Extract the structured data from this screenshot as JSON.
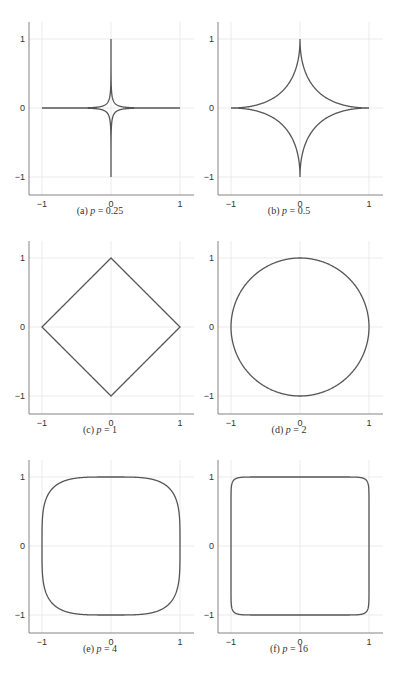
{
  "chart_data": [
    {
      "type": "line",
      "id": "a",
      "label": "(a)",
      "p": 0.25,
      "caption": "(a) p = 0.25",
      "title": "Unit ball boundary |x|^p + |y|^p = 1",
      "xticks": [
        -1,
        0,
        1
      ],
      "yticks": [
        -1,
        0,
        1
      ],
      "xlim": [
        -1.2,
        1.2
      ],
      "ylim": [
        -1.2,
        1.2
      ],
      "grid": true,
      "color": "#555555"
    },
    {
      "type": "line",
      "id": "b",
      "label": "(b)",
      "p": 0.5,
      "caption": "(b) p = 0.5",
      "title": "Unit ball boundary |x|^p + |y|^p = 1",
      "xticks": [
        -1,
        0,
        1
      ],
      "yticks": [
        -1,
        0,
        1
      ],
      "xlim": [
        -1.2,
        1.2
      ],
      "ylim": [
        -1.2,
        1.2
      ],
      "grid": true,
      "color": "#555555"
    },
    {
      "type": "line",
      "id": "c",
      "label": "(c)",
      "p": 1,
      "caption": "(c) p = 1",
      "title": "Unit ball boundary |x|^p + |y|^p = 1",
      "xticks": [
        -1,
        0,
        1
      ],
      "yticks": [
        -1,
        0,
        1
      ],
      "xlim": [
        -1.2,
        1.2
      ],
      "ylim": [
        -1.2,
        1.2
      ],
      "grid": true,
      "color": "#555555"
    },
    {
      "type": "line",
      "id": "d",
      "label": "(d)",
      "p": 2,
      "caption": "(d) p = 2",
      "title": "Unit ball boundary |x|^p + |y|^p = 1",
      "xticks": [
        -1,
        0,
        1
      ],
      "yticks": [
        -1,
        0,
        1
      ],
      "xlim": [
        -1.2,
        1.2
      ],
      "ylim": [
        -1.2,
        1.2
      ],
      "grid": true,
      "color": "#555555"
    },
    {
      "type": "line",
      "id": "e",
      "label": "(e)",
      "p": 4,
      "caption": "(e) p = 4",
      "title": "Unit ball boundary |x|^p + |y|^p = 1",
      "xticks": [
        -1,
        0,
        1
      ],
      "yticks": [
        -1,
        0,
        1
      ],
      "xlim": [
        -1.2,
        1.2
      ],
      "ylim": [
        -1.2,
        1.2
      ],
      "grid": true,
      "color": "#555555"
    },
    {
      "type": "line",
      "id": "f",
      "label": "(f)",
      "p": 16,
      "caption": "(f) p = 16",
      "title": "Unit ball boundary |x|^p + |y|^p = 1",
      "xticks": [
        -1,
        0,
        1
      ],
      "yticks": [
        -1,
        0,
        1
      ],
      "xlim": [
        -1.2,
        1.2
      ],
      "ylim": [
        -1.2,
        1.2
      ],
      "grid": true,
      "color": "#555555"
    }
  ],
  "captions": {
    "a": {
      "prefix": "(a) ",
      "var": "p",
      "rest": " = 0.25"
    },
    "b": {
      "prefix": "(b) ",
      "var": "p",
      "rest": " = 0.5"
    },
    "c": {
      "prefix": "(c) ",
      "var": "p",
      "rest": " = 1"
    },
    "d": {
      "prefix": "(d) ",
      "var": "p",
      "rest": " = 2"
    },
    "e": {
      "prefix": "(e) ",
      "var": "p",
      "rest": " = 4"
    },
    "f": {
      "prefix": "(f) ",
      "var": "p",
      "rest": " = 16"
    }
  }
}
